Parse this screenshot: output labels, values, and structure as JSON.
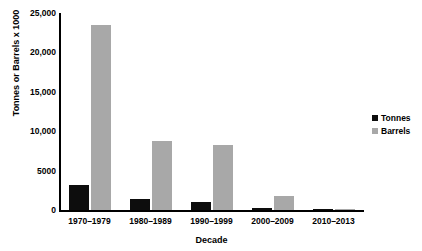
{
  "chart_data": {
    "type": "bar",
    "title": "",
    "xlabel": "Decade",
    "ylabel": "Tonnes or Barrels x 1000",
    "categories": [
      "1970–1979",
      "1980–1989",
      "1990–1999",
      "2000–2009",
      "2010–2013"
    ],
    "series": [
      {
        "name": "Tonnes",
        "color": "#0d0d0d",
        "values": [
          3200,
          1350,
          1050,
          200,
          100
        ]
      },
      {
        "name": "Barrels",
        "color": "#a8a8a8",
        "values": [
          23500,
          8700,
          8250,
          1750,
          150
        ]
      }
    ],
    "ylim": [
      0,
      25000
    ],
    "yticks": [
      0,
      5000,
      10000,
      15000,
      20000,
      25000
    ],
    "ytick_labels": [
      "0",
      "5000",
      "10,000",
      "15,000",
      "20,000",
      "25,000"
    ],
    "grid": false,
    "legend_position": "right"
  }
}
